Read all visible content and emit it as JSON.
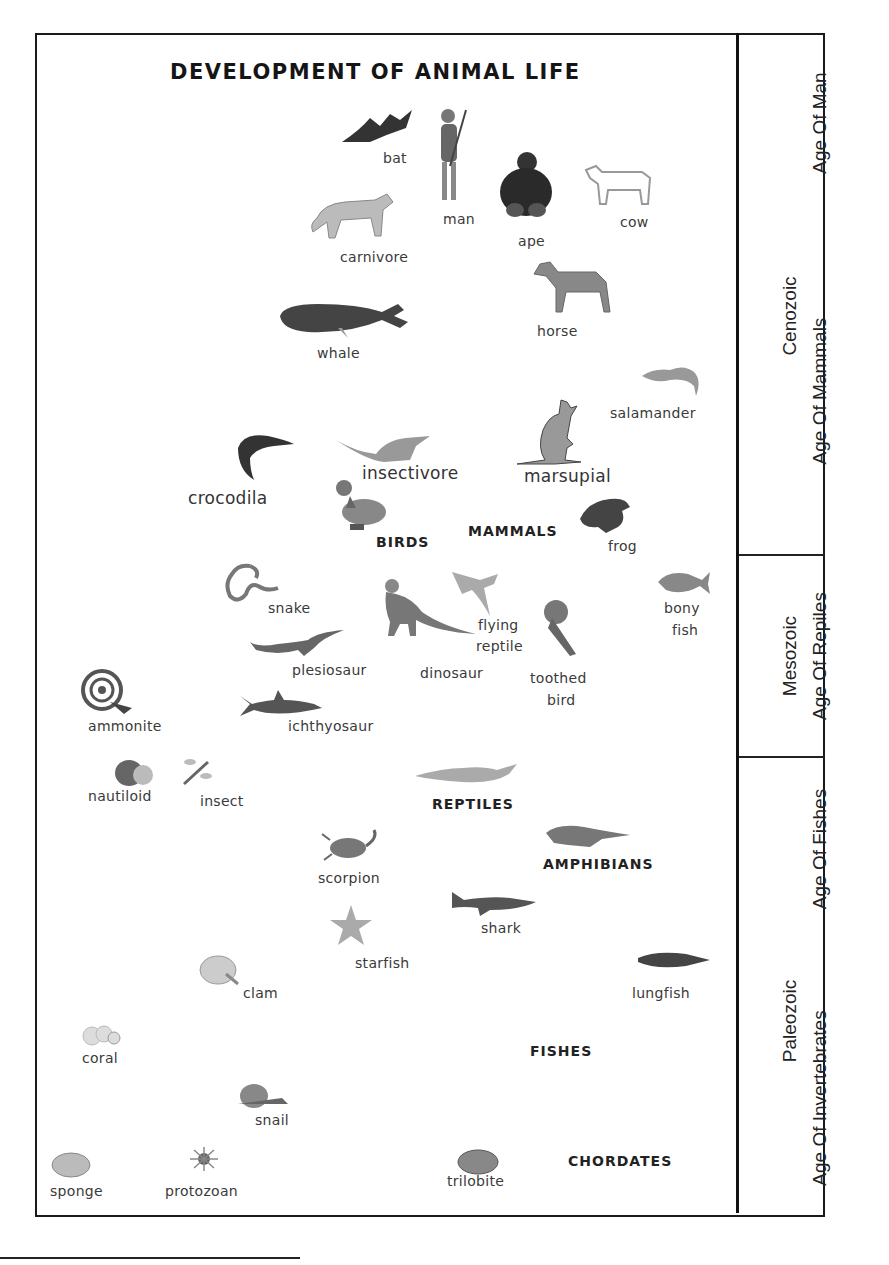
{
  "title": "DEVELOPMENT OF ANIMAL LIFE",
  "animals": {
    "bat": "bat",
    "man": "man",
    "ape": "ape",
    "cow": "cow",
    "carnivore": "carnivore",
    "horse": "horse",
    "whale": "whale",
    "salamander": "salamander",
    "insectivore": "insectivore",
    "marsupial": "marsupial",
    "crocodila": "crocodila",
    "frog": "frog",
    "snake": "snake",
    "bony_fish_1": "bony",
    "bony_fish_2": "fish",
    "flying_reptile_1": "flying",
    "flying_reptile_2": "reptile",
    "plesiosaur": "plesiosaur",
    "dinosaur": "dinosaur",
    "toothed_bird_1": "toothed",
    "toothed_bird_2": "bird",
    "ammonite": "ammonite",
    "ichthyosaur": "ichthyosaur",
    "nautiloid": "nautiloid",
    "insect": "insect",
    "scorpion": "scorpion",
    "shark": "shark",
    "starfish": "starfish",
    "clam": "clam",
    "lungfish": "lungfish",
    "coral": "coral",
    "snail": "snail",
    "sponge": "sponge",
    "protozoan": "protozoan",
    "trilobite": "trilobite"
  },
  "groups": {
    "birds": "BIRDS",
    "mammals": "MAMMALS",
    "reptiles": "REPTILES",
    "amphibians": "AMPHIBIANS",
    "fishes": "FISHES",
    "chordates": "CHORDATES"
  },
  "eras": {
    "cenozoic": "Cenozoic",
    "mesozoic": "Mesozoic",
    "paleozoic": "Paleozoic"
  },
  "ages": {
    "man": "Age Of Man",
    "mammals": "Age Of Mammals",
    "reptiles": "Age Of Repiles",
    "fishes": "Age Of Fishes",
    "invertebrates": "Age Of Invertebrates"
  }
}
